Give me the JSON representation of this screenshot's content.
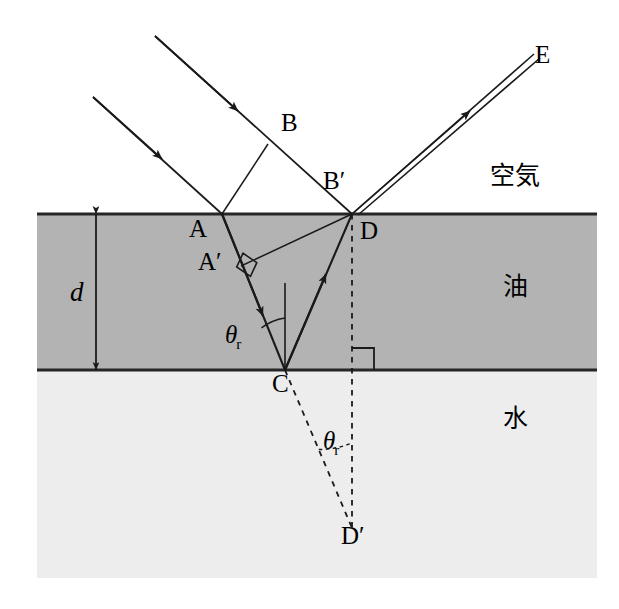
{
  "figure": {
    "width": 619,
    "height": 609,
    "colors": {
      "air": "#ffffff",
      "oil": "#b3b3b3",
      "water": "#ededed",
      "line": "#1a1a1a",
      "boundary": "#262626"
    }
  },
  "media": {
    "air_label": "空気",
    "oil_label": "油",
    "water_label": "水"
  },
  "points": {
    "A": "A",
    "A_prime": "A′",
    "B": "B",
    "B_prime": "B′",
    "C": "C",
    "D": "D",
    "D_prime": "D′",
    "E": "E"
  },
  "dimensions": {
    "thickness_symbol": "d"
  },
  "angles": {
    "refraction_symbol": "θ",
    "refraction_subscript": "r"
  },
  "geometry": {
    "oil_top_y": 214,
    "oil_bottom_y": 370,
    "region_left_x": 37,
    "region_right_x": 597,
    "water_bottom_y": 578,
    "A": [
      222,
      214
    ],
    "B": [
      268,
      131
    ],
    "B_prime": [
      352,
      214
    ],
    "A_prime": [
      245,
      262
    ],
    "C": [
      285,
      370
    ],
    "D": [
      352,
      214
    ],
    "D_prime": [
      352,
      528
    ],
    "E": [
      527,
      57
    ]
  }
}
